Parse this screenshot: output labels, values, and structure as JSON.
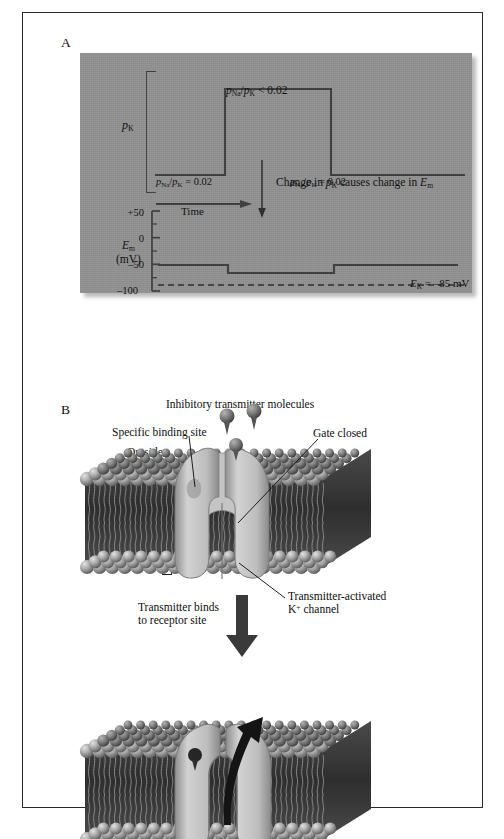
{
  "figure": {
    "panelA": {
      "letter": "A",
      "background_color": "#919191",
      "perm_axis_label_p": "p",
      "perm_axis_label_sub": "K",
      "annotations": {
        "high_state": {
          "p1": "p",
          "sub1": "Na",
          "slash": "/",
          "p2": "p",
          "sub2": "K",
          "relation": " < 0.02"
        },
        "left_state": {
          "p1": "p",
          "sub1": "Na",
          "slash": "/",
          "p2": "p",
          "sub2": "K",
          "relation": " = 0.02"
        },
        "right_state": {
          "p1": "p",
          "sub1": "Na",
          "slash": "/",
          "p2": "p",
          "sub2": "K",
          "relation": " = 0.02"
        },
        "time_axis": "Time",
        "causal_note": {
          "pre": "Change in ",
          "p": "p",
          "sub": "K",
          "mid": " causes change in ",
          "e": "E",
          "esub": "m"
        }
      },
      "em_axis": {
        "label_line1_e": "E",
        "label_line1_sub": "m",
        "label_line2": "(mV)",
        "ticks": [
          "+50",
          "0",
          "–50",
          "–100"
        ],
        "tick_values": [
          50,
          0,
          -50,
          -100
        ]
      },
      "ek_line": {
        "e": "E",
        "sub": "K",
        "value": " = –85 mV"
      }
    },
    "panelB": {
      "letter": "B",
      "title": "Inhibitory transmitter molecules",
      "binding_site": "Specific binding site",
      "outside": "Outside",
      "gate_closed": "Gate closed",
      "postsynaptic_line1": "Postsynaptic",
      "postsynaptic_line2": "membrane",
      "inside": "Inside",
      "channel_line1": "Transmitter-activated",
      "channel_line2_k": "K",
      "channel_line2_sup": "+",
      "channel_line2_rest": " channel",
      "binds_line1": "Transmitter binds",
      "binds_line2": "to receptor site",
      "ion_k": "K",
      "ion_k_sup": "+"
    }
  },
  "chart_data": [
    {
      "type": "line",
      "title": "Potassium permeability step",
      "ylabel": "pK",
      "xlabel": "Time",
      "x": [
        0,
        0.225,
        0.225,
        0.565,
        0.565,
        1.0
      ],
      "values": [
        0,
        0,
        1,
        1,
        0,
        0
      ],
      "annotations": [
        "pNa/pK = 0.02",
        "pNa/pK < 0.02",
        "pNa/pK = 0.02"
      ],
      "grid": false,
      "legend": "none"
    },
    {
      "type": "line",
      "title": "Membrane potential response",
      "ylabel": "Em (mV)",
      "xlabel": "Time",
      "ylim": [
        -100,
        50
      ],
      "yticks": [
        50,
        0,
        -50,
        -100
      ],
      "x": [
        0,
        0.225,
        0.225,
        0.565,
        0.565,
        1.0
      ],
      "values": [
        -70,
        -70,
        -76,
        -76,
        -70,
        -70
      ],
      "reference_line": {
        "label": "EK = -85 mV",
        "value": -85,
        "style": "dashed"
      },
      "grid": false,
      "legend": "none"
    }
  ]
}
